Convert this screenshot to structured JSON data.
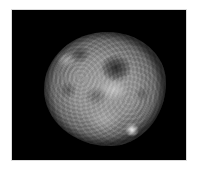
{
  "image": {
    "subject": "fluorescence micrograph of a cell nucleus",
    "background_color": "#000000",
    "page_background": "#ffffff",
    "nucleus": {
      "description": "mottled grayscale nucleus with dark nucleolar regions and a bright spot at lower right",
      "features": [
        {
          "type": "dark-region",
          "position": "upper-right"
        },
        {
          "type": "dark-region",
          "position": "upper-left"
        },
        {
          "type": "bright-spot",
          "position": "lower-right"
        }
      ]
    }
  }
}
